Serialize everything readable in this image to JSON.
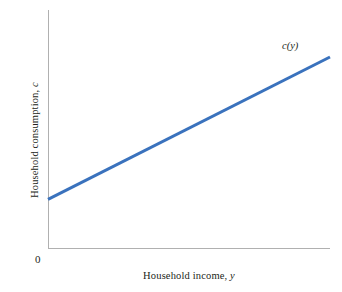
{
  "chart_data": {
    "type": "line",
    "title": "",
    "xlabel": "Household income, y",
    "ylabel": "Household consumption, c",
    "origin_label": "0",
    "grid": false,
    "legend_position": "inline-end-of-line",
    "axis_color": "#b0b0b0",
    "series": [
      {
        "name": "c(y)",
        "label": "c(y)",
        "color": "#3a72bd",
        "line_width": 3,
        "points": [
          {
            "x": 0,
            "y": 20.6
          },
          {
            "x": 100,
            "y": 80.3
          }
        ],
        "description": "Upward sloping consumption function with positive intercept (autonomous consumption) and constant marginal propensity to consume less than one"
      }
    ],
    "xlim": [
      0,
      100
    ],
    "ylim": [
      0,
      100
    ],
    "x_ticks": [],
    "y_ticks": [],
    "annotations": [
      {
        "text": "c(y)",
        "x": 100,
        "y": 87,
        "style": "italic"
      }
    ]
  },
  "axis_labels": {
    "y_text_prefix": "Household consumption, ",
    "y_text_italic": "c",
    "x_text_prefix": "Household income, ",
    "x_text_italic": "y",
    "origin": "0"
  },
  "series_label": {
    "text": "c(y)"
  },
  "colors": {
    "line": "#3a72bd",
    "axis": "#b0b0b0",
    "text": "#231f20",
    "background": "#ffffff"
  }
}
